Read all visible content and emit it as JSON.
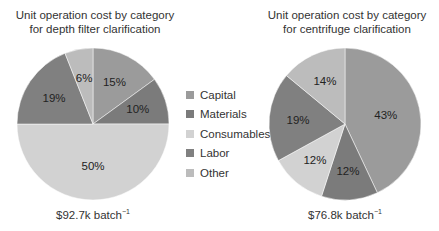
{
  "chart_data": [
    {
      "type": "pie",
      "title": "Unit operation cost by category for depth filter clarification",
      "title_lines": [
        "Unit operation cost by category",
        "for depth filter clarification"
      ],
      "categories": [
        "Capital",
        "Materials",
        "Consumables",
        "Labor",
        "Other"
      ],
      "values": [
        15,
        10,
        50,
        19,
        6
      ],
      "labels": [
        "15%",
        "10%",
        "50%",
        "19%",
        "6%"
      ],
      "total": "$92.7k batch",
      "total_sup": "−1"
    },
    {
      "type": "pie",
      "title": "Unit operation cost by category for centrifuge clarification",
      "title_lines": [
        "Unit operation cost by category",
        "for centrifuge clarification"
      ],
      "categories": [
        "Capital",
        "Materials",
        "Consumables",
        "Labor",
        "Other"
      ],
      "values": [
        43,
        12,
        12,
        19,
        14
      ],
      "labels": [
        "43%",
        "12%",
        "12%",
        "19%",
        "14%"
      ],
      "total": "$76.8k batch",
      "total_sup": "−1"
    }
  ],
  "legend": {
    "position": "center",
    "items": [
      {
        "label": "Capital",
        "color": "#9b9b9b"
      },
      {
        "label": "Materials",
        "color": "#7b7b7b"
      },
      {
        "label": "Consumables",
        "color": "#d2d2d2"
      },
      {
        "label": "Labor",
        "color": "#808080"
      },
      {
        "label": "Other",
        "color": "#bcbcbc"
      }
    ]
  }
}
